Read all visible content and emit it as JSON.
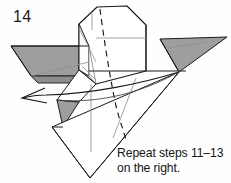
{
  "figure": {
    "step_number": "14",
    "caption_line_1": "Repeat steps 11–13",
    "caption_line_2": "on the right.",
    "type": "origami-folding-diagram"
  },
  "colors": {
    "background": "#fefefe",
    "line": "#1a1a1a",
    "thin_line": "#7b7b7b",
    "shade_gray": "#9e9e9e",
    "shade_gray_dark": "#8a8a8a",
    "shade_gray_light": "#b4b4b4",
    "text": "#151515"
  },
  "geometry": {
    "left_wing": {
      "name": "left-wing-shaded-quad",
      "points": "11,46 89,46 89,77 30,77",
      "fill": "#9e9e9e"
    },
    "left_wing_under": {
      "name": "left-wing-under-band",
      "points": "30,77 89,77 89,83 36,83",
      "fill": "#8a8a8a"
    },
    "right_wing": {
      "name": "right-wing-shaded-triangle",
      "points": "161,40 226,38 178,72",
      "fill": "#9e9e9e"
    },
    "lower_flap": {
      "name": "lower-flap-shaded-triangle",
      "points": "58,100 77,101 62,127",
      "fill": "#9e9e9e"
    },
    "body_outline": {
      "name": "central-body-outline",
      "points": "79,23 97,7 127,6 145,24 145,72 96,84 79,70"
    },
    "sweep_arrow": {
      "name": "fold-sweep-arrow",
      "from": "178,72",
      "to": "22,98",
      "direction": "left"
    },
    "dashed_fold": {
      "name": "dashed-valley-fold-line",
      "style": "dashed"
    },
    "bottom_point": {
      "name": "bottom-vertex",
      "point": "90,178"
    }
  }
}
